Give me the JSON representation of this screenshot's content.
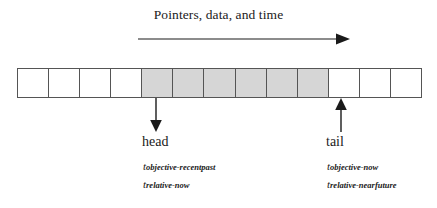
{
  "figure": {
    "title": "Pointers, data, and time",
    "time_arrow": {
      "direction": "left-to-right",
      "icon": "right-arrow-icon"
    }
  },
  "array": {
    "total_cells": 13,
    "cells": [
      {
        "index": 0,
        "state": "empty"
      },
      {
        "index": 1,
        "state": "empty"
      },
      {
        "index": 2,
        "state": "empty"
      },
      {
        "index": 3,
        "state": "empty"
      },
      {
        "index": 4,
        "state": "filled"
      },
      {
        "index": 5,
        "state": "filled"
      },
      {
        "index": 6,
        "state": "filled"
      },
      {
        "index": 7,
        "state": "filled"
      },
      {
        "index": 8,
        "state": "filled"
      },
      {
        "index": 9,
        "state": "filled"
      },
      {
        "index": 10,
        "state": "empty"
      },
      {
        "index": 11,
        "state": "empty"
      },
      {
        "index": 12,
        "state": "empty"
      }
    ],
    "filled_color": "#d6d6d6",
    "empty_color": "#ffffff",
    "border_color": "#555555"
  },
  "pointers": {
    "head": {
      "label": "head",
      "arrow_icon": "down-arrow-icon",
      "times": [
        {
          "symbol": "t",
          "subscript": "objective-recentpast"
        },
        {
          "symbol": "t",
          "subscript": "relative-now"
        }
      ]
    },
    "tail": {
      "label": "tail",
      "arrow_icon": "up-arrow-icon",
      "times": [
        {
          "symbol": "t",
          "subscript": "objective-now"
        },
        {
          "symbol": "t",
          "subscript": "relative-nearfuture"
        }
      ]
    }
  }
}
